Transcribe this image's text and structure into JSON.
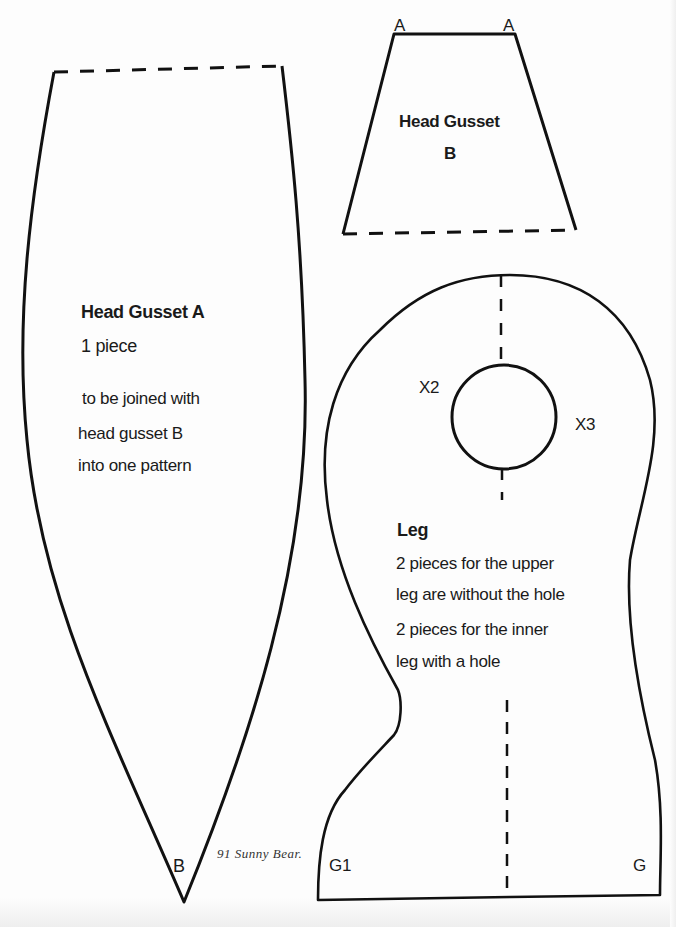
{
  "page": {
    "caption": "91 Sunny Bear."
  },
  "pieces": {
    "head_gusset_a": {
      "title": "Head Gusset  A",
      "lines": [
        "1  piece",
        "to be joined with",
        "head gusset B",
        "into one pattern"
      ],
      "point_label": "B"
    },
    "head_gusset_b": {
      "title_line1": "Head Gusset",
      "title_line2": "B",
      "corner_left": "A",
      "corner_right": "A"
    },
    "leg": {
      "title": "Leg",
      "lines": [
        "2 pieces for the upper",
        "leg are without the hole",
        "2 pieces for the inner",
        "leg with a hole"
      ],
      "mark_x2": "X2",
      "mark_x3": "X3",
      "corner_left": "G1",
      "corner_right": "G"
    }
  }
}
